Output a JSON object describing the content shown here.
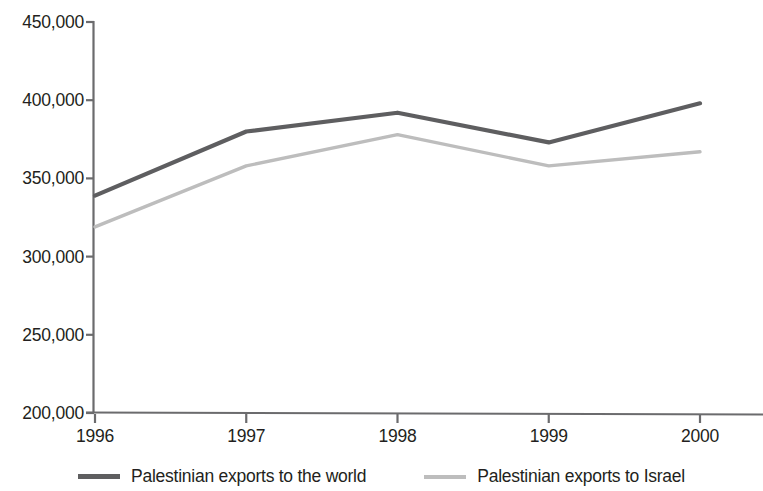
{
  "chart_data": {
    "type": "line",
    "title": "",
    "subtitle": "",
    "xlabel": "",
    "ylabel": "",
    "categories": [
      "1996",
      "1997",
      "1998",
      "1999",
      "2000"
    ],
    "x": [
      1996,
      1997,
      1998,
      1999,
      2000
    ],
    "series": [
      {
        "name": "Palestinian exports to the world",
        "color": "#5e5e60",
        "values": [
          339000,
          380000,
          392000,
          373000,
          398000
        ]
      },
      {
        "name": "Palestinian exports to Israel",
        "color": "#bdbdbd",
        "values": [
          319000,
          358000,
          378000,
          358000,
          367000
        ]
      }
    ],
    "ylim": [
      200000,
      450000
    ],
    "ytick_step": 50000,
    "y_ticks": [
      450000,
      400000,
      350000,
      300000,
      250000,
      200000
    ],
    "y_tick_labels": [
      "450,000",
      "400,000",
      "350,000",
      "300,000",
      "250,000",
      "200,000"
    ],
    "x_tick_labels": [
      "1996",
      "1997",
      "1998",
      "1999",
      "2000"
    ],
    "grid": false,
    "legend_position": "bottom",
    "axis_color": "#6b6b6d",
    "background": "#ffffff"
  },
  "legend": {
    "entries": [
      {
        "label": "Palestinian exports to the world",
        "swatch": "line-swatch-dark"
      },
      {
        "label": "Palestinian exports to Israel",
        "swatch": "line-swatch-light"
      }
    ]
  }
}
